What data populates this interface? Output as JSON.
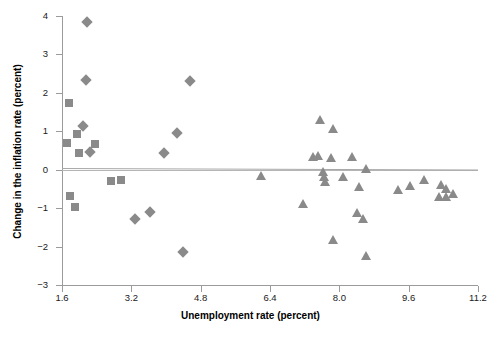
{
  "chart_data": {
    "type": "scatter",
    "title": "",
    "xlabel": "Unemployment rate (percent)",
    "ylabel": "Change in the inflation rate (percent)",
    "xlim": [
      1.6,
      11.2
    ],
    "ylim": [
      -3,
      4
    ],
    "xticks": [
      "1.6",
      "3.2",
      "4.8",
      "6.4",
      "8.0",
      "9.6",
      "11.2"
    ],
    "yticks": [
      "4",
      "3",
      "2",
      "1",
      "0",
      "-1",
      "-2",
      "-3"
    ],
    "grid": false,
    "legend": "none",
    "marker_color": "#8a8a8a",
    "annotations": [
      "horizontal reference line at y = 0",
      "fitted trend line, nearly flat slightly negative"
    ],
    "series": [
      {
        "name": "square-markers",
        "marker": "square",
        "points": [
          [
            1.75,
            1.73
          ],
          [
            1.72,
            0.7
          ],
          [
            1.95,
            0.93
          ],
          [
            2.0,
            0.44
          ],
          [
            2.35,
            0.67
          ],
          [
            1.78,
            -0.68
          ],
          [
            1.9,
            -0.97
          ],
          [
            2.72,
            -0.3
          ],
          [
            2.95,
            -0.27
          ]
        ]
      },
      {
        "name": "diamond-markers",
        "marker": "diamond",
        "points": [
          [
            2.18,
            3.84
          ],
          [
            2.16,
            2.33
          ],
          [
            2.08,
            1.14
          ],
          [
            2.25,
            0.47
          ],
          [
            4.55,
            2.31
          ],
          [
            4.25,
            0.95
          ],
          [
            3.95,
            0.44
          ],
          [
            3.28,
            -1.28
          ],
          [
            3.62,
            -1.1
          ],
          [
            4.4,
            -2.13
          ]
        ]
      },
      {
        "name": "triangle-markers",
        "marker": "triangle",
        "points": [
          [
            6.2,
            -0.17
          ],
          [
            7.15,
            -0.9
          ],
          [
            7.55,
            1.3
          ],
          [
            7.85,
            1.06
          ],
          [
            7.4,
            0.33
          ],
          [
            7.5,
            0.36
          ],
          [
            7.8,
            0.3
          ],
          [
            8.3,
            0.33
          ],
          [
            7.62,
            -0.07
          ],
          [
            7.65,
            -0.2
          ],
          [
            7.68,
            -0.32
          ],
          [
            8.08,
            -0.2
          ],
          [
            8.45,
            -0.45
          ],
          [
            8.62,
            0.02
          ],
          [
            8.4,
            -1.13
          ],
          [
            8.55,
            -1.28
          ],
          [
            7.85,
            -1.83
          ],
          [
            8.62,
            -2.25
          ],
          [
            9.35,
            -0.52
          ],
          [
            9.62,
            -0.42
          ],
          [
            9.95,
            -0.27
          ],
          [
            10.35,
            -0.4
          ],
          [
            10.45,
            -0.5
          ],
          [
            10.3,
            -0.7
          ],
          [
            10.45,
            -0.72
          ],
          [
            10.62,
            -0.62
          ]
        ]
      }
    ]
  },
  "axis": {
    "x_title": "Unemployment rate (percent)",
    "y_title": "Change in the inflation rate (percent)"
  }
}
